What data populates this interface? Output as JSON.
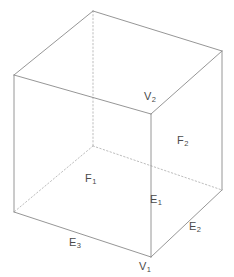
{
  "figure": {
    "type": "geometry-diagram",
    "shape_name": "cube",
    "width": 234,
    "height": 277,
    "background_color": "#ffffff",
    "stroke_color": "#8a8a8a",
    "hidden_stroke_color": "#b5b5b5",
    "label_color": "#4a4a4a"
  },
  "labels": {
    "v1": {
      "base": "V",
      "sub": "1",
      "x": 139,
      "y": 261
    },
    "v2": {
      "base": "V",
      "sub": "2",
      "x": 144,
      "y": 91
    },
    "e1": {
      "base": "E",
      "sub": "1",
      "x": 150,
      "y": 194
    },
    "e2": {
      "base": "E",
      "sub": "2",
      "x": 189,
      "y": 221
    },
    "e3": {
      "base": "E",
      "sub": "3",
      "x": 69,
      "y": 237
    },
    "f1": {
      "base": "F",
      "sub": "1",
      "x": 85,
      "y": 173
    },
    "f2": {
      "base": "F",
      "sub": "2",
      "x": 177,
      "y": 135
    }
  },
  "geometry": {
    "vertices": {
      "top_back": {
        "x": 93,
        "y": 11
      },
      "top_left": {
        "x": 14,
        "y": 75
      },
      "top_right": {
        "x": 222,
        "y": 51
      },
      "top_front": {
        "x": 151,
        "y": 114
      },
      "bottom_back": {
        "x": 93,
        "y": 146
      },
      "bottom_left": {
        "x": 14,
        "y": 212
      },
      "bottom_right": {
        "x": 222,
        "y": 190
      },
      "bottom_front": {
        "x": 151,
        "y": 257
      }
    },
    "visible_edges": [
      [
        "top_back",
        "top_left"
      ],
      [
        "top_back",
        "top_right"
      ],
      [
        "top_left",
        "top_front"
      ],
      [
        "top_right",
        "top_front"
      ],
      [
        "top_left",
        "bottom_left"
      ],
      [
        "top_right",
        "bottom_right"
      ],
      [
        "top_front",
        "bottom_front"
      ],
      [
        "bottom_left",
        "bottom_front"
      ],
      [
        "bottom_right",
        "bottom_front"
      ]
    ],
    "hidden_edges": [
      [
        "top_back",
        "bottom_back"
      ],
      [
        "bottom_back",
        "bottom_left"
      ],
      [
        "bottom_back",
        "bottom_right"
      ]
    ]
  }
}
